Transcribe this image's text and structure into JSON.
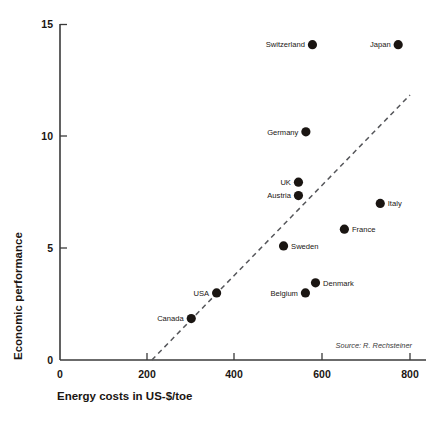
{
  "chart_data": {
    "type": "scatter",
    "title": "",
    "xlabel": "Energy costs in US-$/toe",
    "ylabel": "Economic performance",
    "xlim": [
      0,
      840
    ],
    "ylim": [
      0,
      15
    ],
    "xticks": [
      0,
      200,
      400,
      600,
      800
    ],
    "xtick_labels": [
      "0",
      "200",
      "400",
      "600",
      "800"
    ],
    "yticks": [
      0,
      5,
      10,
      15
    ],
    "ytick_labels": [
      "0",
      "5",
      "10",
      "15"
    ],
    "grid": false,
    "legend": "none",
    "annotations": [
      {
        "text": "Source: R. Rechsteiner",
        "x": 745,
        "y": 0.65,
        "style": "italic"
      }
    ],
    "trend_line": {
      "type": "dashed",
      "x0": 210,
      "y0": 0,
      "x1": 800,
      "y1": 11.85
    },
    "points": [
      {
        "label": "Switzerland",
        "x": 577,
        "y": 14.1,
        "label_side": "left"
      },
      {
        "label": "Japan",
        "x": 773,
        "y": 14.1,
        "label_side": "left"
      },
      {
        "label": "Germany",
        "x": 562,
        "y": 10.2,
        "label_side": "left"
      },
      {
        "label": "UK",
        "x": 545,
        "y": 7.95,
        "label_side": "left"
      },
      {
        "label": "Austria",
        "x": 545,
        "y": 7.35,
        "label_side": "left"
      },
      {
        "label": "Italy",
        "x": 732,
        "y": 7.0,
        "label_side": "right"
      },
      {
        "label": "France",
        "x": 650,
        "y": 5.85,
        "label_side": "right"
      },
      {
        "label": "Sweden",
        "x": 511,
        "y": 5.1,
        "label_side": "right"
      },
      {
        "label": "Denmark",
        "x": 584,
        "y": 3.45,
        "label_side": "right"
      },
      {
        "label": "Belgium",
        "x": 561,
        "y": 3.0,
        "label_side": "left"
      },
      {
        "label": "USA",
        "x": 358,
        "y": 3.0,
        "label_side": "left"
      },
      {
        "label": "Canada",
        "x": 300,
        "y": 1.85,
        "label_side": "left"
      }
    ]
  }
}
